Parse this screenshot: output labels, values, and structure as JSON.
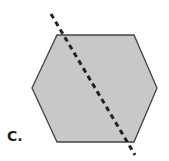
{
  "label": "C.",
  "shape": {
    "type": "hexagon",
    "fill": "#c8c8c8",
    "stroke": "#444444",
    "points": "57,35 134,35 157,88 134,142 57,142 32,88"
  },
  "line": {
    "style": "dashed",
    "color": "#222222",
    "x1": 51,
    "y1": 14,
    "x2": 135,
    "y2": 155
  }
}
